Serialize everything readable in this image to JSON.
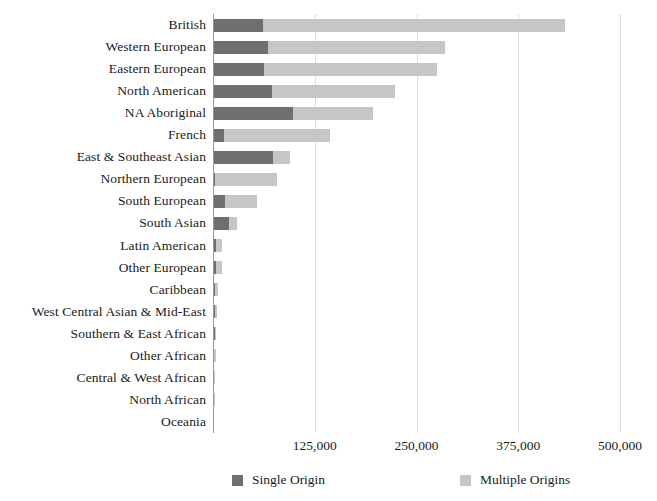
{
  "chart_data": {
    "type": "bar",
    "orientation": "horizontal",
    "stacked": true,
    "title": "",
    "subtitle": "",
    "xlabel": "",
    "ylabel": "",
    "xlim": [
      0,
      500000
    ],
    "grid": true,
    "legend_position": "bottom",
    "xticks": [
      {
        "value": 125000,
        "label": "125,000"
      },
      {
        "value": 250000,
        "label": "250,000"
      },
      {
        "value": 375000,
        "label": "375,000"
      },
      {
        "value": 500000,
        "label": "500,000"
      }
    ],
    "categories": [
      "British",
      "Western European",
      "Eastern European",
      "North American",
      "NA Aboriginal",
      "French",
      "East & Southeast Asian",
      "Northern European",
      "South European",
      "South Asian",
      "Latin American",
      "Other European",
      "Caribbean",
      "West Central Asian & Mid-East",
      "Southern & East African",
      "Other African",
      "Central & West African",
      "North African",
      "Oceania"
    ],
    "series": [
      {
        "name": "Single Origin",
        "color": "#6f6f6f",
        "values": [
          61000,
          67000,
          63000,
          72000,
          98000,
          14000,
          74000,
          3000,
          15000,
          20000,
          4000,
          4000,
          2500,
          2000,
          2000,
          1200,
          1200,
          900,
          300
        ]
      },
      {
        "name": "Multiple Origins",
        "color": "#c6c6c6",
        "values": [
          371000,
          218000,
          212000,
          151000,
          98000,
          130000,
          20000,
          76000,
          39000,
          10000,
          7000,
          7000,
          4000,
          2500,
          2000,
          2500,
          1200,
          600,
          300
        ]
      }
    ],
    "totals": [
      432000,
      285000,
      275000,
      223000,
      196000,
      144000,
      94000,
      79000,
      54000,
      30000,
      11000,
      11000,
      6500,
      4500,
      4000,
      3700,
      2400,
      1500,
      600
    ]
  },
  "legend": {
    "items": [
      {
        "label": "Single Origin",
        "color": "#6f6f6f"
      },
      {
        "label": "Multiple Origins",
        "color": "#c6c6c6"
      }
    ]
  },
  "colors": {
    "single_origin": "#6f6f6f",
    "multiple_origins": "#c6c6c6",
    "gridline": "#dcdcdc",
    "axis": "#9a9a9a",
    "text": "#1a1a1a",
    "background": "#ffffff"
  }
}
